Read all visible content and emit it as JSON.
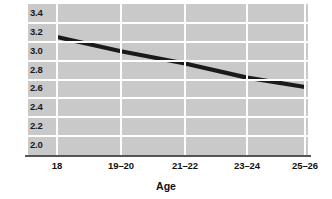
{
  "chart_data": {
    "type": "line",
    "title": "",
    "xlabel": "Age",
    "ylabel": "Risk-taking score",
    "categories": [
      "18",
      "19–20",
      "21–22",
      "23–24",
      "25–26"
    ],
    "values": [
      3.15,
      3.0,
      2.87,
      2.72,
      2.62
    ],
    "series": [
      {
        "name": "Risk-taking score",
        "values": [
          3.15,
          3.0,
          2.87,
          2.72,
          2.62
        ],
        "color": "#1a1a1a"
      }
    ],
    "ylim": [
      1.9,
      3.5
    ],
    "yticks": [
      "3.4",
      "3.2",
      "3.0",
      "2.8",
      "2.6",
      "2.4",
      "2.2",
      "2.0"
    ],
    "ytick_values": [
      3.4,
      3.2,
      3.0,
      2.8,
      2.6,
      2.4,
      2.2,
      2.0
    ],
    "grid": "horizontal-and-vertical white gridlines on gray panel",
    "legend": "none",
    "plot_background": "#c9c9c9",
    "gridline_color": "#ffffff",
    "axis_color": "#555555"
  },
  "axes": {
    "x_title": "Age",
    "y_title": "Risk-taking score"
  },
  "caption": {
    "partial_text": ""
  }
}
